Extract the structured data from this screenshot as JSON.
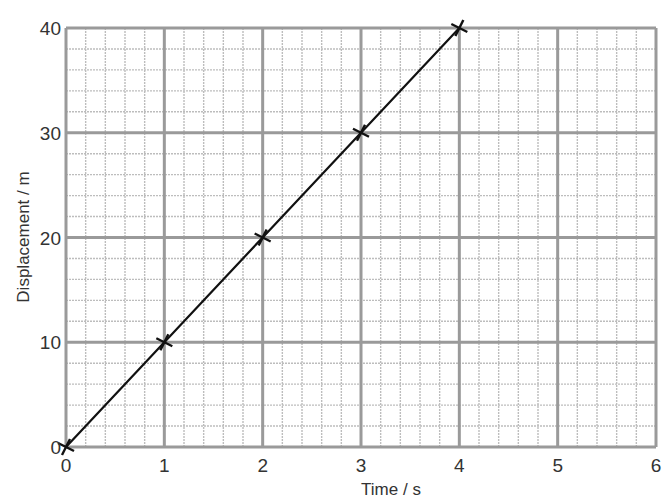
{
  "chart_data": {
    "type": "line",
    "title": "",
    "xlabel": "Time / s",
    "ylabel": "Displacement / m",
    "x": [
      0,
      1,
      2,
      3,
      4
    ],
    "series": [
      {
        "name": "Displacement",
        "values": [
          0,
          10,
          20,
          30,
          40
        ],
        "marker": "x",
        "color": "#111111"
      }
    ],
    "x_ticks": [
      "0",
      "1",
      "2",
      "3",
      "4",
      "5",
      "6"
    ],
    "y_ticks": [
      "0",
      "10",
      "20",
      "30",
      "40"
    ],
    "xlim": [
      0,
      6
    ],
    "ylim": [
      0,
      40
    ],
    "grid": true,
    "grid_minor_per_major": 5,
    "legend": "none"
  },
  "colors": {
    "major_grid": "#9a9a9a",
    "minor_grid": "#bdbdbd",
    "line": "#111111",
    "text": "#333333"
  }
}
